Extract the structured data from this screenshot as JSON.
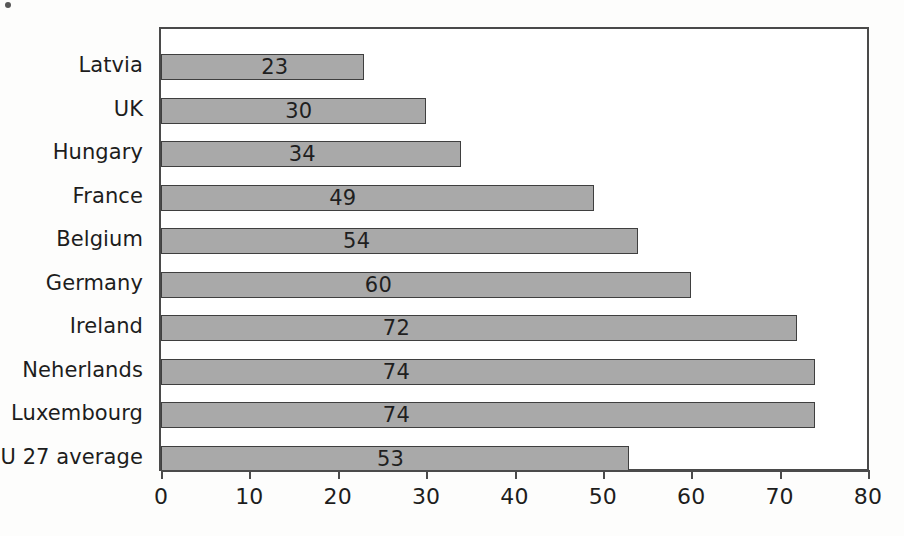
{
  "chart_data": {
    "type": "bar",
    "orientation": "horizontal",
    "title": "",
    "subtitle": "",
    "xlabel": "",
    "ylabel": "",
    "categories": [
      "Latvia",
      "UK",
      "Hungary",
      "France",
      "Belgium",
      "Germany",
      "Ireland",
      "Neherlands",
      "Luxembourg",
      "EU 27 average"
    ],
    "values": [
      23,
      30,
      34,
      49,
      54,
      60,
      72,
      74,
      74,
      53
    ],
    "data_labels": [
      "23",
      "30",
      "34",
      "49",
      "54",
      "60",
      "72",
      "74",
      "74",
      "53"
    ],
    "xlim": [
      0,
      80
    ],
    "x_ticks": [
      0,
      10,
      20,
      30,
      40,
      50,
      60,
      70,
      80
    ],
    "x_tick_labels": [
      "0",
      "10",
      "20",
      "30",
      "40",
      "50",
      "60",
      "70",
      "80"
    ],
    "grid": false,
    "legend": false,
    "legend_position": "none",
    "bar_fill_color": "#a9a9a9",
    "bar_border_color": "#3f3f3f",
    "axis_color": "#4b4b4b",
    "text_color": "#1d1d1d",
    "background_color": "#fdfdfc",
    "plot_background_color": "#ffffff",
    "label_positions_pct": [
      56,
      52,
      47,
      42,
      41,
      41,
      37,
      36,
      36,
      49
    ]
  }
}
